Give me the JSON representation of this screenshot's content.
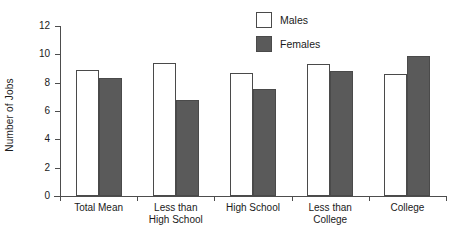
{
  "chart_data": {
    "type": "bar",
    "title": "",
    "xlabel": "",
    "ylabel": "Number of Jobs",
    "ylim": [
      0,
      12
    ],
    "yticks": [
      0,
      2,
      4,
      6,
      8,
      10,
      12
    ],
    "grid": false,
    "legend_position": "top-center",
    "categories": [
      "Total Mean",
      "Less than High School",
      "High School",
      "Less than College",
      "College"
    ],
    "category_lines": [
      [
        "Total Mean"
      ],
      [
        "Less than",
        "High School"
      ],
      [
        "High School"
      ],
      [
        "Less than",
        "College"
      ],
      [
        "College"
      ]
    ],
    "series": [
      {
        "name": "Males",
        "color": "#ffffff",
        "border": "#4a4a4a",
        "values": [
          8.9,
          9.4,
          8.65,
          9.35,
          8.6
        ]
      },
      {
        "name": "Females",
        "color": "#5a5a5a",
        "border": "#4a4a4a",
        "values": [
          8.3,
          6.8,
          7.55,
          8.8,
          9.9
        ]
      }
    ]
  },
  "axis": {
    "tick_labels": [
      "12",
      "10",
      "8",
      "6",
      "4",
      "2",
      "0"
    ]
  },
  "legend": {
    "items": [
      {
        "label": "Males"
      },
      {
        "label": "Females"
      }
    ]
  },
  "colors": {
    "axis": "#4d4d4d",
    "text": "#1a1a1a",
    "females_fill": "#5a5a5a",
    "males_fill": "#ffffff",
    "bar_border": "#4a4a4a",
    "background": "#ffffff"
  }
}
